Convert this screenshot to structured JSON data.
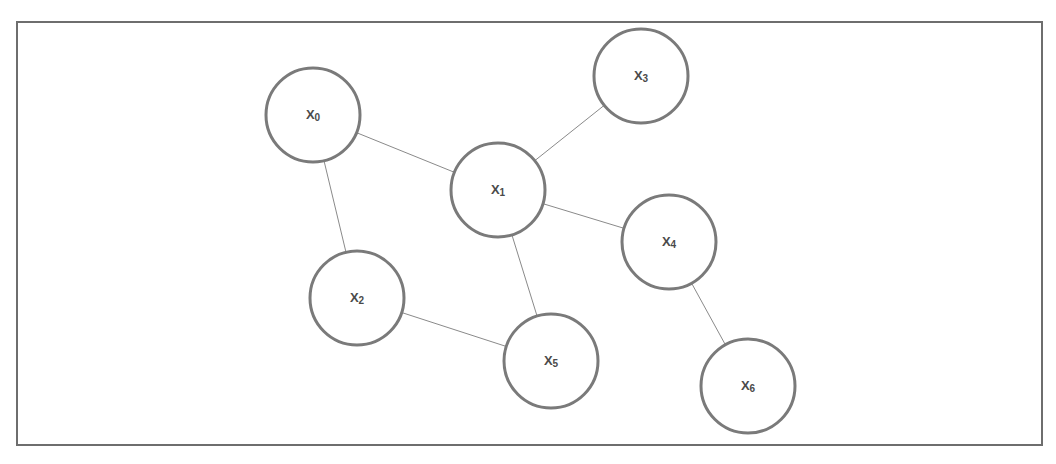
{
  "diagram": {
    "type": "undirected-graph",
    "frame": {
      "x": 17,
      "y": 22,
      "width": 1025,
      "height": 423
    },
    "node_radius": 47,
    "nodes": [
      {
        "id": "x0",
        "base": "X",
        "sub": "0",
        "cx": 313,
        "cy": 115
      },
      {
        "id": "x1",
        "base": "X",
        "sub": "1",
        "cx": 498,
        "cy": 190
      },
      {
        "id": "x2",
        "base": "X",
        "sub": "2",
        "cx": 357,
        "cy": 298
      },
      {
        "id": "x3",
        "base": "X",
        "sub": "3",
        "cx": 641,
        "cy": 76
      },
      {
        "id": "x4",
        "base": "X",
        "sub": "4",
        "cx": 669,
        "cy": 242
      },
      {
        "id": "x5",
        "base": "X",
        "sub": "5",
        "cx": 551,
        "cy": 361
      },
      {
        "id": "x6",
        "base": "X",
        "sub": "6",
        "cx": 748,
        "cy": 386
      }
    ],
    "edges": [
      {
        "from": "x0",
        "to": "x1"
      },
      {
        "from": "x0",
        "to": "x2"
      },
      {
        "from": "x1",
        "to": "x3"
      },
      {
        "from": "x1",
        "to": "x4"
      },
      {
        "from": "x1",
        "to": "x5"
      },
      {
        "from": "x2",
        "to": "x5"
      },
      {
        "from": "x4",
        "to": "x6"
      }
    ]
  }
}
